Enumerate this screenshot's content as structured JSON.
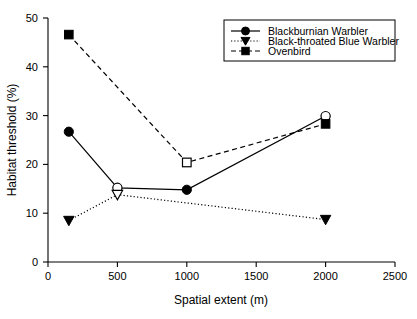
{
  "chart_data": {
    "type": "line",
    "title": "",
    "xlabel": "Spatial extent (m)",
    "ylabel": "Habitat threshold (%)",
    "xlim": [
      0,
      2500
    ],
    "ylim": [
      0,
      50
    ],
    "xticks": [
      0,
      500,
      1000,
      1500,
      2000,
      2500
    ],
    "yticks": [
      0,
      10,
      20,
      30,
      40,
      50
    ],
    "xtick_labels": [
      "0",
      "500",
      "1000",
      "1500",
      "2000",
      "2500"
    ],
    "ytick_labels": [
      "0",
      "10",
      "20",
      "30",
      "40",
      "50"
    ],
    "grid": false,
    "legend_position": "top-right",
    "series": [
      {
        "name": "Blackburnian Warbler",
        "linestyle": "solid",
        "marker": "circle",
        "x": [
          150,
          500,
          1000,
          2000
        ],
        "values": [
          26.7,
          15.2,
          14.8,
          29.9
        ],
        "marker_fill": [
          "filled",
          "open",
          "filled",
          "open"
        ]
      },
      {
        "name": "Black-throated Blue Warbler",
        "linestyle": "dotted",
        "marker": "triangle-down",
        "x": [
          150,
          500,
          2000
        ],
        "values": [
          8.5,
          13.8,
          8.7
        ],
        "marker_fill": [
          "filled",
          "open",
          "filled"
        ]
      },
      {
        "name": "Ovenbird",
        "linestyle": "dashed",
        "marker": "square",
        "x": [
          150,
          1000,
          2000
        ],
        "values": [
          46.6,
          20.4,
          28.3
        ],
        "marker_fill": [
          "filled",
          "open",
          "filled"
        ]
      }
    ]
  },
  "legend": {
    "items": [
      {
        "label": "Blackburnian Warbler"
      },
      {
        "label": "Black-throated Blue Warbler"
      },
      {
        "label": "Ovenbird"
      }
    ]
  },
  "colors": {
    "ink": "#000000",
    "background": "#ffffff"
  }
}
